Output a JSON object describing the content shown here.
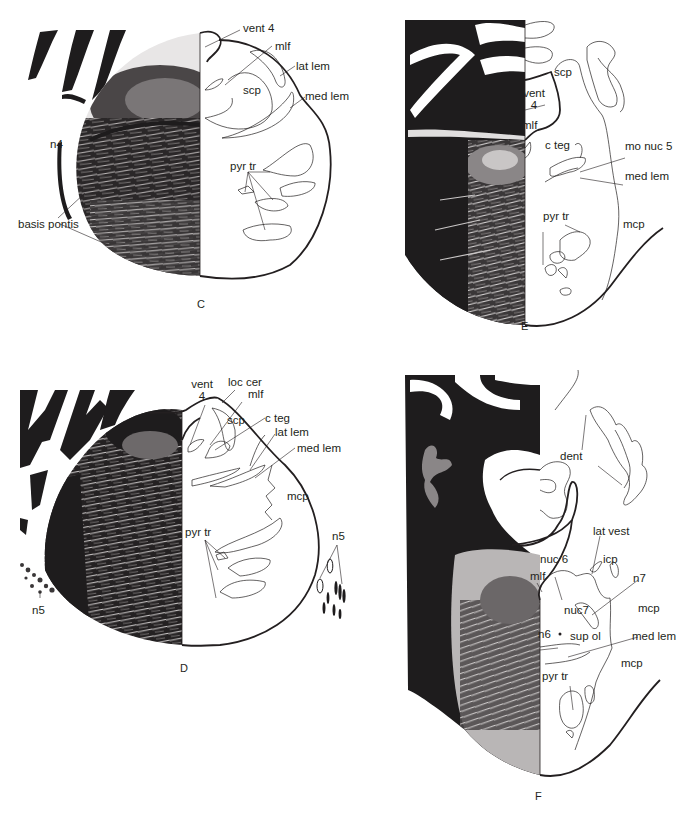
{
  "figure": {
    "panels": [
      {
        "id": "C",
        "letter": "C",
        "labels": [
          "vent 4",
          "mlf",
          "lat lem",
          "scp",
          "med lem",
          "n4",
          "pyr tr",
          "basis pontis"
        ]
      },
      {
        "id": "E",
        "letter": "E",
        "labels": [
          "scp",
          "vent",
          "4",
          "mlf",
          "c teg",
          "mo nuc 5",
          "med lem",
          "pyr tr",
          "mcp"
        ]
      },
      {
        "id": "D",
        "letter": "D",
        "labels": [
          "vent",
          "4",
          "loc cer",
          "mlf",
          "scp",
          "c teg",
          "lat lem",
          "med lem",
          "mcp",
          "pyr tr",
          "n5",
          "n5"
        ]
      },
      {
        "id": "F",
        "letter": "F",
        "labels": [
          "dent",
          "lat vest",
          "nuc 6",
          "icp",
          "mlf",
          "n7",
          "nuc7",
          "mcp",
          "n6",
          "sup ol",
          "med lem",
          "mcp",
          "pyr tr"
        ]
      }
    ]
  },
  "panel_c": {
    "letter": "C",
    "vent4": "vent 4",
    "mlf": "mlf",
    "lat_lem": "lat lem",
    "scp": "scp",
    "med_lem": "med lem",
    "n4": "n4",
    "pyr_tr": "pyr tr",
    "basis_pontis": "basis pontis"
  },
  "panel_e": {
    "letter": "E",
    "scp": "scp",
    "vent": "vent",
    "vent_num": "4",
    "mlf": "mlf",
    "c_teg": "c teg",
    "mo_nuc5": "mo nuc 5",
    "med_lem": "med lem",
    "pyr_tr": "pyr tr",
    "mcp": "mcp"
  },
  "panel_d": {
    "letter": "D",
    "vent": "vent",
    "vent_num": "4",
    "loc_cer": "loc cer",
    "mlf": "mlf",
    "scp": "scp",
    "c_teg": "c teg",
    "lat_lem": "lat lem",
    "med_lem": "med lem",
    "mcp": "mcp",
    "pyr_tr": "pyr tr",
    "n5_right": "n5",
    "n5_left": "n5"
  },
  "panel_f": {
    "letter": "F",
    "dent": "dent",
    "lat_vest": "lat vest",
    "nuc6": "nuc 6",
    "icp": "icp",
    "mlf": "mlf",
    "n7": "n7",
    "nuc7": "nuc7",
    "mcp_upper": "mcp",
    "n6": "n6",
    "sup_ol": "sup ol",
    "med_lem": "med lem",
    "mcp_lower": "mcp",
    "pyr_tr": "pyr tr"
  },
  "colors": {
    "ink": "#231f20",
    "stain_dark": "#1e1c1d",
    "stain_mid": "#5a5758",
    "stain_light": "#b9b6b6",
    "paper": "#ffffff"
  }
}
